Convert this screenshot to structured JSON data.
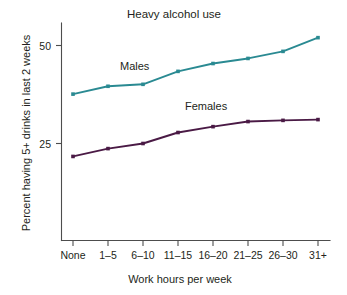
{
  "chart_data": {
    "type": "line",
    "title": "Heavy alcohol use",
    "xlabel": "Work hours per week",
    "ylabel": "Percent having 5+ drinks in last 2 weeks",
    "categories": [
      "None",
      "1–5",
      "6–10",
      "11–15",
      "16–20",
      "21–25",
      "26–30",
      "31+"
    ],
    "series": [
      {
        "name": "Males",
        "color": "#2a8a92",
        "values": [
          37.6,
          39.6,
          40.1,
          43.4,
          45.4,
          46.7,
          48.5,
          52.0
        ]
      },
      {
        "name": "Females",
        "color": "#4a1a45",
        "values": [
          21.7,
          23.7,
          25.0,
          27.8,
          29.3,
          30.6,
          30.9,
          31.1
        ]
      }
    ],
    "y_ticks": [
      25,
      50
    ],
    "y_tick_labels": [
      "25",
      "50"
    ],
    "ylim": [
      0,
      55
    ],
    "grid": false,
    "legend_position": "inline-annotations",
    "annotations": [
      {
        "text": "Males",
        "series": "Males"
      },
      {
        "text": "Females",
        "series": "Females"
      }
    ]
  },
  "labels": {
    "title": "Heavy alcohol use",
    "y_axis_title": "Percent having 5+ drinks in last 2 weeks",
    "x_axis_title": "Work hours per week",
    "y_tick_50": "50",
    "y_tick_25": "25",
    "x_tick_0": "None",
    "x_tick_1": "1–5",
    "x_tick_2": "6–10",
    "x_tick_3": "11–15",
    "x_tick_4": "16–20",
    "x_tick_5": "21–25",
    "x_tick_6": "26–30",
    "x_tick_7": "31+",
    "series_label_males": "Males",
    "series_label_females": "Females"
  },
  "colors": {
    "males": "#2a8a92",
    "females": "#4a1a45",
    "axis": "#4d4d4d",
    "text": "#231f20",
    "background": "#ffffff"
  }
}
